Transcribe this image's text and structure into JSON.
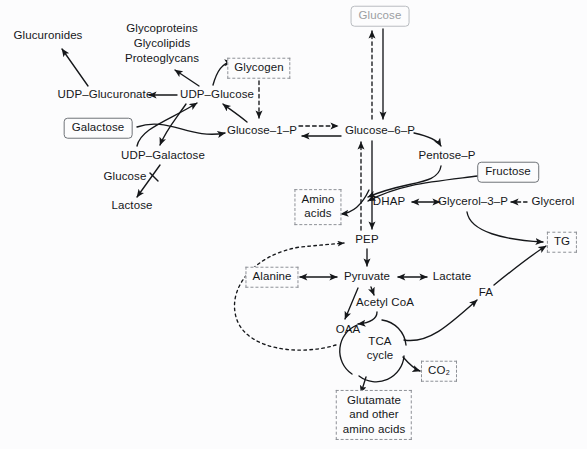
{
  "diagram": {
    "background_color": "#fcfcfd",
    "stroke_color": "#15171a",
    "solid_box_border": "#6f7378",
    "dashed_box_border": "#8d9096",
    "muted_text_color": "#9b9ea2"
  },
  "nodes": [
    {
      "id": "glucuronides",
      "label": "Glucuronides",
      "style": "plain",
      "x": 48,
      "y": 36
    },
    {
      "id": "glycoproteins",
      "label": "Glycoproteins",
      "style": "plain",
      "x": 162,
      "y": 29
    },
    {
      "id": "glycolipids",
      "label": "Glycolipids",
      "style": "plain",
      "x": 162,
      "y": 44
    },
    {
      "id": "proteoglycans",
      "label": "Proteoglycans",
      "style": "plain",
      "x": 162,
      "y": 59
    },
    {
      "id": "glycogen",
      "label": "Glycogen",
      "style": "dashed",
      "x": 259,
      "y": 68
    },
    {
      "id": "glucose",
      "label": "Glucose",
      "style": "solid-muted",
      "x": 380,
      "y": 16
    },
    {
      "id": "udp-glucuronate",
      "label": "UDP–Glucuronate",
      "style": "plain",
      "x": 105,
      "y": 95
    },
    {
      "id": "udp-glucose",
      "label": "UDP–Glucose",
      "style": "plain",
      "x": 217,
      "y": 95
    },
    {
      "id": "galactose",
      "label": "Galactose",
      "style": "solid",
      "x": 98,
      "y": 128
    },
    {
      "id": "glucose-1-p",
      "label": "Glucose–1–P",
      "style": "plain",
      "x": 262,
      "y": 131
    },
    {
      "id": "glucose-6-p",
      "label": "Glucose–6–P",
      "style": "plain",
      "x": 380,
      "y": 131
    },
    {
      "id": "udp-galactose",
      "label": "UDP–Galactose",
      "style": "plain",
      "x": 163,
      "y": 156
    },
    {
      "id": "pentose-p",
      "label": "Pentose–P",
      "style": "plain",
      "x": 447,
      "y": 156
    },
    {
      "id": "fructose",
      "label": "Fructose",
      "style": "solid",
      "x": 508,
      "y": 172
    },
    {
      "id": "glucose-free",
      "label": "Glucose",
      "style": "plain",
      "x": 125,
      "y": 177
    },
    {
      "id": "lactose",
      "label": "Lactose",
      "style": "plain",
      "x": 132,
      "y": 206
    },
    {
      "id": "amino-acids",
      "label": "Amino\nacids",
      "style": "dashed",
      "x": 318,
      "y": 207
    },
    {
      "id": "dhap",
      "label": "DHAP",
      "style": "plain",
      "x": 389,
      "y": 202
    },
    {
      "id": "glycerol-3-p",
      "label": "Glycerol–3–P",
      "style": "plain",
      "x": 473,
      "y": 202
    },
    {
      "id": "glycerol",
      "label": "Glycerol",
      "style": "plain",
      "x": 553,
      "y": 202
    },
    {
      "id": "pep",
      "label": "PEP",
      "style": "plain",
      "x": 367,
      "y": 240
    },
    {
      "id": "tg",
      "label": "TG",
      "style": "dashed",
      "x": 562,
      "y": 242
    },
    {
      "id": "alanine",
      "label": "Alanine",
      "style": "dashed",
      "x": 272,
      "y": 277
    },
    {
      "id": "pyruvate",
      "label": "Pyruvate",
      "style": "plain",
      "x": 367,
      "y": 277
    },
    {
      "id": "lactate",
      "label": "Lactate",
      "style": "plain",
      "x": 452,
      "y": 277
    },
    {
      "id": "acetyl-coa",
      "label": "Acetyl CoA",
      "style": "plain",
      "x": 385,
      "y": 303
    },
    {
      "id": "fa",
      "label": "FA",
      "style": "plain",
      "x": 486,
      "y": 293
    },
    {
      "id": "oaa",
      "label": "OAA",
      "style": "plain",
      "x": 348,
      "y": 330
    },
    {
      "id": "tca-cycle",
      "label": "TCA\ncycle",
      "style": "plain",
      "x": 380,
      "y": 348
    },
    {
      "id": "co2",
      "label": "CO₂",
      "style": "dashed",
      "x": 439,
      "y": 371
    },
    {
      "id": "glutamate",
      "label": "Glutamate\nand other\namino acids",
      "style": "dashed",
      "x": 374,
      "y": 415
    }
  ],
  "edges": [
    {
      "from": "udp-glucuronate",
      "to": "glucuronides",
      "kind": "arrow",
      "reversible": false
    },
    {
      "from": "udp-glucose",
      "to": "udp-glucuronate",
      "kind": "arrow",
      "reversible": false
    },
    {
      "from": "udp-glucose",
      "to": "glycoproteins",
      "kind": "arrow",
      "reversible": false
    },
    {
      "from": "udp-glucose",
      "to": "glycogen",
      "kind": "arrow",
      "reversible": false
    },
    {
      "from": "glycogen",
      "to": "glucose-1-p",
      "kind": "dashed-arrow",
      "reversible": false
    },
    {
      "from": "glucose-1-p",
      "to": "udp-glucose",
      "kind": "arrow",
      "reversible": false
    },
    {
      "from": "galactose",
      "to": "glucose-1-p",
      "kind": "arrow",
      "reversible": false
    },
    {
      "from": "udp-galactose",
      "to": "udp-glucose",
      "kind": "double-arrow",
      "reversible": true
    },
    {
      "from": "udp-galactose",
      "to": "lactose",
      "kind": "arrow",
      "reversible": false
    },
    {
      "from": "glucose-free",
      "to": "lactose",
      "kind": "line",
      "reversible": false
    },
    {
      "from": "glucose",
      "to": "glucose-6-p",
      "kind": "arrow",
      "reversible": false
    },
    {
      "from": "glucose-6-p",
      "to": "glucose",
      "kind": "dashed-arrow",
      "reversible": false
    },
    {
      "from": "glucose-6-p",
      "to": "glucose-1-p",
      "kind": "arrow",
      "reversible": false
    },
    {
      "from": "glucose-1-p",
      "to": "glucose-6-p",
      "kind": "dashed-arrow",
      "reversible": false
    },
    {
      "from": "glucose-6-p",
      "to": "pentose-p",
      "kind": "arrow",
      "reversible": false
    },
    {
      "from": "pentose-p",
      "to": "dhap",
      "kind": "arrow",
      "reversible": false
    },
    {
      "from": "fructose",
      "to": "dhap",
      "kind": "arrow",
      "reversible": false
    },
    {
      "from": "dhap",
      "to": "glycerol-3-p",
      "kind": "double-arrow",
      "reversible": true
    },
    {
      "from": "glycerol",
      "to": "glycerol-3-p",
      "kind": "dashed-arrow",
      "reversible": false
    },
    {
      "from": "glycerol-3-p",
      "to": "tg",
      "kind": "arrow",
      "reversible": false
    },
    {
      "from": "glucose-6-p",
      "to": "pep",
      "kind": "arrow",
      "reversible": false
    },
    {
      "from": "pep",
      "to": "glucose-6-p",
      "kind": "dashed-arrow",
      "reversible": false
    },
    {
      "from": "pep",
      "to": "amino-acids",
      "kind": "arrow",
      "reversible": false
    },
    {
      "from": "pep",
      "to": "pyruvate",
      "kind": "arrow",
      "reversible": false
    },
    {
      "from": "alanine",
      "to": "pyruvate",
      "kind": "double-arrow",
      "reversible": true
    },
    {
      "from": "pyruvate",
      "to": "lactate",
      "kind": "double-arrow",
      "reversible": true
    },
    {
      "from": "pyruvate",
      "to": "acetyl-coa",
      "kind": "arrow",
      "reversible": false
    },
    {
      "from": "pyruvate",
      "to": "oaa",
      "kind": "arrow",
      "reversible": false
    },
    {
      "from": "acetyl-coa",
      "to": "tca-cycle",
      "kind": "arrow",
      "reversible": false
    },
    {
      "from": "tca-cycle",
      "to": "co2",
      "kind": "arrow",
      "reversible": false
    },
    {
      "from": "tca-cycle",
      "to": "glutamate",
      "kind": "arrow",
      "reversible": false
    },
    {
      "from": "tca-cycle",
      "to": "fa",
      "kind": "arrow",
      "reversible": false
    },
    {
      "from": "fa",
      "to": "tg",
      "kind": "arrow",
      "reversible": false
    },
    {
      "from": "oaa",
      "to": "pep",
      "kind": "dotted-loop",
      "reversible": false
    }
  ]
}
